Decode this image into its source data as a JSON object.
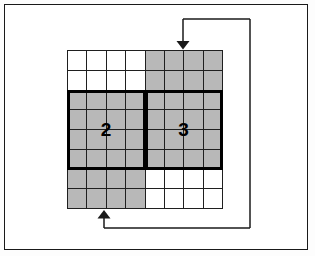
{
  "figure": {
    "title": "",
    "type": "block-grid-feedback-diagram",
    "frame": {
      "border_color": "#1a1a1a",
      "background": "#ffffff"
    }
  },
  "grid": {
    "rows": 8,
    "columns": 8,
    "cell_border_color": "#1f1f1f",
    "shaded_color": "#b8b8b8",
    "unshaded_color": "#ffffff",
    "shading_matrix": [
      [
        0,
        0,
        0,
        0,
        1,
        1,
        1,
        1
      ],
      [
        0,
        0,
        0,
        0,
        1,
        1,
        1,
        1
      ],
      [
        1,
        1,
        1,
        1,
        1,
        1,
        1,
        1
      ],
      [
        1,
        1,
        1,
        1,
        1,
        1,
        1,
        1
      ],
      [
        1,
        1,
        1,
        1,
        1,
        1,
        1,
        1
      ],
      [
        1,
        1,
        1,
        1,
        1,
        1,
        1,
        1
      ],
      [
        1,
        1,
        1,
        1,
        0,
        0,
        0,
        0
      ],
      [
        1,
        1,
        1,
        1,
        0,
        0,
        0,
        0
      ]
    ]
  },
  "blocks": [
    {
      "label": "2",
      "row_start": 2,
      "row_end": 5,
      "col_start": 0,
      "col_end": 3,
      "border_color": "#000000"
    },
    {
      "label": "3",
      "row_start": 2,
      "row_end": 5,
      "col_start": 4,
      "col_end": 7,
      "border_color": "#000000"
    }
  ],
  "connectors": {
    "line_color": "#1a1a1a",
    "input_arrow": {
      "name": "top-input-arrow",
      "direction": "down",
      "tip_x": 183,
      "tip_y": 47
    },
    "output_arrow": {
      "name": "bottom-output-arrow",
      "direction": "up",
      "tip_x": 104,
      "tip_y": 211
    },
    "feedback_path": "from bottom of grid, right along y=228 to x=250, up to y=19, left to x=183, down into grid top"
  }
}
